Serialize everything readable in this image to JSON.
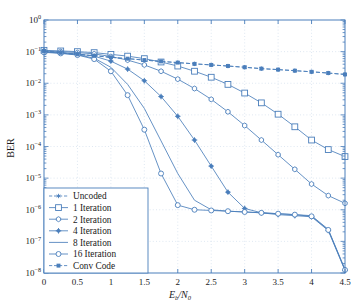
{
  "chart_data": {
    "type": "line",
    "title": "",
    "xlabel": "Eb/N0",
    "ylabel": "BER",
    "xlim": [
      0,
      4.5
    ],
    "ylim_log10": [
      -8,
      0
    ],
    "grid": true,
    "legend_position": "bottom-left",
    "xticks": [
      "0",
      "0.5",
      "1",
      "1.5",
      "2",
      "2.5",
      "3",
      "3.5",
      "4",
      "4.5"
    ],
    "xtick_values": [
      0,
      0.5,
      1,
      1.5,
      2,
      2.5,
      3,
      3.5,
      4,
      4.5
    ],
    "yticks": [
      "10^0",
      "10^-1",
      "10^-2",
      "10^-3",
      "10^-4",
      "10^-5",
      "10^-6",
      "10^-7",
      "10^-8"
    ],
    "ytick_exponents": [
      0,
      -1,
      -2,
      -3,
      -4,
      -5,
      -6,
      -7,
      -8
    ],
    "color": "#4a7ebb",
    "series": [
      {
        "name": "Uncoded",
        "marker": "asterisk",
        "x": [
          0,
          0.25,
          0.5,
          0.75,
          1,
          1.25,
          1.5,
          1.75,
          2,
          2.25,
          2.5,
          2.75,
          3,
          3.25,
          3.5,
          3.75,
          4,
          4.25,
          4.5
        ],
        "y": [
          0.105,
          0.092,
          0.082,
          0.074,
          0.066,
          0.06,
          0.054,
          0.049,
          0.045,
          0.041,
          0.038,
          0.035,
          0.032,
          0.029,
          0.027,
          0.025,
          0.023,
          0.021,
          0.019
        ]
      },
      {
        "name": "1 Iteration",
        "marker": "square-open",
        "x": [
          0,
          0.25,
          0.5,
          0.75,
          1,
          1.25,
          1.5,
          1.75,
          2,
          2.25,
          2.5,
          2.75,
          3,
          3.25,
          3.5,
          3.75,
          4,
          4.25,
          4.5
        ],
        "y": [
          0.11,
          0.105,
          0.1,
          0.093,
          0.082,
          0.072,
          0.06,
          0.047,
          0.035,
          0.024,
          0.0155,
          0.0092,
          0.0049,
          0.0024,
          0.00105,
          0.00042,
          0.00016,
          8e-05,
          4.8e-05
        ]
      },
      {
        "name": "2 Iteration",
        "marker": "hexagon",
        "x": [
          0,
          0.25,
          0.5,
          0.75,
          1,
          1.25,
          1.5,
          1.75,
          2,
          2.25,
          2.5,
          2.75,
          3,
          3.25,
          3.5,
          3.75,
          4,
          4.25,
          4.5
        ],
        "y": [
          0.105,
          0.1,
          0.093,
          0.085,
          0.07,
          0.054,
          0.038,
          0.024,
          0.0135,
          0.0068,
          0.0031,
          0.00125,
          0.00046,
          0.00016,
          5.5e-05,
          1.9e-05,
          6.5e-06,
          2.8e-06,
          1.6e-06
        ]
      },
      {
        "name": "4 Iteration",
        "marker": "plus-filled",
        "x": [
          0,
          0.25,
          0.5,
          0.75,
          1,
          1.25,
          1.5,
          1.75,
          2,
          2.25,
          2.5,
          2.75,
          3,
          3.25,
          3.5,
          3.75,
          4,
          4.25,
          4.5
        ],
        "y": [
          0.1,
          0.093,
          0.085,
          0.072,
          0.05,
          0.028,
          0.012,
          0.0038,
          0.0009,
          0.00016,
          2.4e-05,
          3.6e-06,
          1.1e-06,
          8e-07,
          7e-07,
          6.5e-07,
          6e-07,
          2.2e-07,
          1.2e-08
        ]
      },
      {
        "name": "8 Iteration",
        "marker": "none",
        "x": [
          0,
          0.25,
          0.5,
          0.75,
          1,
          1.25,
          1.5,
          1.75,
          2,
          2.25,
          2.5,
          2.75,
          3,
          3.25,
          3.5,
          3.75,
          4,
          4.25,
          4.5
        ],
        "y": [
          0.098,
          0.09,
          0.08,
          0.062,
          0.032,
          0.0092,
          0.0016,
          0.00015,
          1.4e-05,
          2e-06,
          1e-06,
          9e-07,
          8.5e-07,
          8e-07,
          7.5e-07,
          7e-07,
          6.5e-07,
          2.4e-07,
          1.3e-08
        ]
      },
      {
        "name": "16 Iteration",
        "marker": "circle-open",
        "x": [
          0,
          0.25,
          0.5,
          0.75,
          1,
          1.25,
          1.5,
          1.75,
          2,
          2.25,
          2.5,
          2.75,
          3,
          3.25,
          3.5,
          3.75,
          4,
          4.25,
          4.5
        ],
        "y": [
          0.095,
          0.088,
          0.078,
          0.058,
          0.024,
          0.0042,
          0.00034,
          1.4e-05,
          1.4e-06,
          1e-06,
          9.5e-07,
          9e-07,
          8.5e-07,
          8e-07,
          7.5e-07,
          7e-07,
          6.2e-07,
          2.3e-07,
          1.25e-08
        ]
      },
      {
        "name": "Conv Code",
        "marker": "square-small",
        "x": [
          0,
          0.25,
          0.5,
          0.75,
          1,
          1.25,
          1.5,
          1.75,
          2,
          2.25,
          2.5,
          2.75,
          3,
          3.25,
          3.5,
          3.75,
          4,
          4.25,
          4.5
        ],
        "y": [
          0.105,
          0.092,
          0.082,
          0.074,
          0.066,
          0.06,
          0.054,
          0.049,
          0.045,
          0.041,
          0.038,
          0.035,
          0.032,
          0.029,
          0.027,
          0.025,
          0.023,
          0.021,
          0.019
        ]
      }
    ]
  },
  "legend": {
    "items": [
      {
        "label": "Uncoded",
        "marker": "asterisk"
      },
      {
        "label": "1 Iteration",
        "marker": "square-open"
      },
      {
        "label": "2 Iteration",
        "marker": "hexagon"
      },
      {
        "label": "4 Iteration",
        "marker": "plus-filled"
      },
      {
        "label": "8 Iteration",
        "marker": "none"
      },
      {
        "label": "16 Iteration",
        "marker": "circle-open"
      },
      {
        "label": "Conv Code",
        "marker": "square-small"
      }
    ]
  },
  "axes": {
    "ylabel": "BER",
    "xlabel_main": "E",
    "xlabel_sub1": "b",
    "xlabel_slash": "/N",
    "xlabel_sub2": "0"
  }
}
